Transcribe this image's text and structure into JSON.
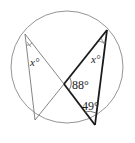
{
  "diagram": {
    "type": "inscribed-angles-circle",
    "circle": {
      "cx": 67,
      "cy": 67,
      "r": 56,
      "stroke": "#888888"
    },
    "points": {
      "A": {
        "x": 25,
        "y": 34
      },
      "B": {
        "x": 35,
        "y": 120
      },
      "C": {
        "x": 107,
        "y": 30
      },
      "D": {
        "x": 95,
        "y": 125
      },
      "E": {
        "x": 64,
        "y": 84
      }
    },
    "labels": {
      "angle_left": "x°",
      "angle_right": "x°",
      "angle_88": "88°",
      "angle_49": "49°"
    },
    "colors": {
      "thin": "#777777",
      "bold": "#1a1a1a"
    }
  }
}
